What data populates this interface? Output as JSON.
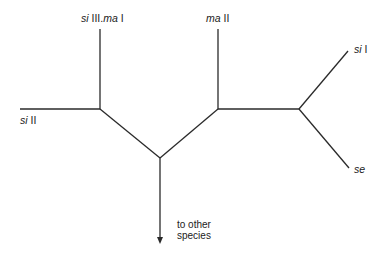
{
  "diagram": {
    "type": "unrooted-tree",
    "nodes": [
      {
        "id": "n_left",
        "x": 100,
        "y": 109
      },
      {
        "id": "n_bottom",
        "x": 160,
        "y": 158
      },
      {
        "id": "n_mid",
        "x": 218,
        "y": 109
      },
      {
        "id": "n_right",
        "x": 299,
        "y": 109
      }
    ],
    "leaves": [
      {
        "id": "si_II",
        "italic": "si",
        "roman": " II",
        "end": [
          20,
          109
        ]
      },
      {
        "id": "si_III_ma_I",
        "italic": "si",
        "roman": " III.",
        "italic2": "ma",
        "roman2": " I",
        "end": [
          100,
          29
        ]
      },
      {
        "id": "ma_II",
        "italic": "ma",
        "roman": " II",
        "end": [
          218,
          29
        ]
      },
      {
        "id": "si_I",
        "italic": "si",
        "roman": " I",
        "end": [
          348,
          51
        ]
      },
      {
        "id": "se",
        "italic": "se",
        "roman": "",
        "end": [
          349,
          168
        ]
      }
    ],
    "outgroup": {
      "label_line1": "to other",
      "label_line2": "species",
      "end": [
        160,
        243
      ]
    }
  }
}
